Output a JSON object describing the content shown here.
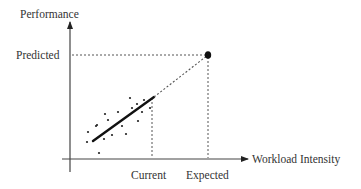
{
  "diagram": {
    "type": "prediction-extrapolation",
    "axes": {
      "y_label": "Performance",
      "x_label": "Workload Intensity"
    },
    "markers": {
      "y_marker": "Predicted",
      "x_markers": [
        "Current",
        "Expected"
      ]
    },
    "colors": {
      "axis": "#333333",
      "points": "#222222",
      "fit_line": "#111111",
      "guide": "#555555"
    },
    "scatter_points": [
      [
        88,
        132
      ],
      [
        87,
        142
      ],
      [
        97,
        125
      ],
      [
        96,
        126
      ],
      [
        104,
        139
      ],
      [
        112,
        135
      ],
      [
        99,
        153
      ],
      [
        105,
        114
      ],
      [
        108,
        120
      ],
      [
        130,
        98
      ],
      [
        132,
        108
      ],
      [
        137,
        104
      ],
      [
        144,
        100
      ],
      [
        122,
        126
      ],
      [
        138,
        121
      ],
      [
        126,
        134
      ],
      [
        150,
        108
      ],
      [
        118,
        112
      ],
      [
        142,
        112
      ]
    ],
    "fit_line": {
      "from": [
        93,
        141
      ],
      "to": [
        154,
        97
      ]
    },
    "extrapolation": {
      "from": [
        154,
        97
      ],
      "to": [
        208,
        55
      ]
    },
    "predicted_point": [
      208,
      55
    ]
  }
}
